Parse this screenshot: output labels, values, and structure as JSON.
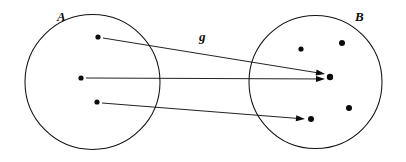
{
  "figure": {
    "type": "set-function-diagram",
    "title_visible": false,
    "background_color": "#ffffff",
    "ink_color": "#0a0a0a",
    "width": 406,
    "height": 162,
    "sets": [
      {
        "id": "A",
        "label": "A",
        "label_x": 57,
        "label_y": 21,
        "center_x": 92.5,
        "center_y": 82,
        "radius": 67.5,
        "elements": [
          {
            "id": "a1",
            "x": 98,
            "y": 37,
            "r": 2.6
          },
          {
            "id": "a2",
            "x": 81,
            "y": 78,
            "r": 2.6
          },
          {
            "id": "a3",
            "x": 97,
            "y": 102,
            "r": 2.6
          }
        ]
      },
      {
        "id": "B",
        "label": "B",
        "label_x": 355,
        "label_y": 21,
        "center_x": 315.5,
        "center_y": 82,
        "radius": 66.5,
        "elements": [
          {
            "id": "b1",
            "x": 301,
            "y": 49,
            "r": 2.6
          },
          {
            "id": "b2",
            "x": 342,
            "y": 43,
            "r": 3.0
          },
          {
            "id": "b3",
            "x": 330,
            "y": 77,
            "r": 3.2
          },
          {
            "id": "b4",
            "x": 349,
            "y": 108,
            "r": 3.0
          },
          {
            "id": "b5",
            "x": 311,
            "y": 119,
            "r": 3.0
          }
        ]
      }
    ],
    "mapping": {
      "label": "g",
      "label_x": 199,
      "label_y": 41,
      "arrows": [
        {
          "id": "arrow-a1-b3",
          "from": "a1",
          "to": "b3",
          "x1": 103,
          "y1": 38,
          "x2": 325,
          "y2": 74
        },
        {
          "id": "arrow-a2-b3",
          "from": "a2",
          "to": "b3",
          "x1": 86,
          "y1": 78,
          "x2": 325,
          "y2": 79
        },
        {
          "id": "arrow-a3-b5",
          "from": "a3",
          "to": "b5",
          "x1": 102,
          "y1": 103,
          "x2": 305,
          "y2": 119
        }
      ]
    }
  }
}
